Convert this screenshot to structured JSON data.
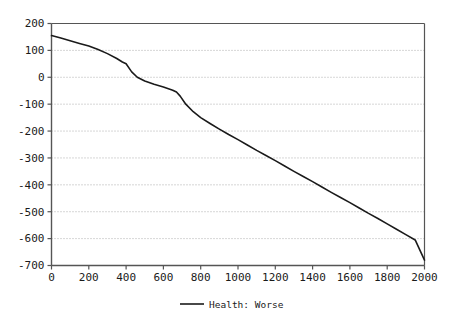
{
  "chart_data": {
    "type": "line",
    "title": "",
    "xlabel": "",
    "ylabel": "",
    "xlim": [
      0,
      2000
    ],
    "ylim": [
      -700,
      200
    ],
    "grid": true,
    "legend_position": "bottom-center",
    "x_ticks": [
      0,
      200,
      400,
      600,
      800,
      1000,
      1200,
      1400,
      1600,
      1800,
      2000
    ],
    "y_ticks": [
      200,
      100,
      0,
      -100,
      -200,
      -300,
      -400,
      -500,
      -600,
      -700
    ],
    "x_tick_labels": [
      "0",
      "200",
      "400",
      "600",
      "800",
      "1000",
      "1200",
      "1400",
      "1600",
      "1800",
      "2000"
    ],
    "y_tick_labels": [
      "200",
      "100",
      "0",
      "-100",
      "-200",
      "-300",
      "-400",
      "-500",
      "-600",
      "-700"
    ],
    "series": [
      {
        "name": "Health: Worse",
        "color": "#1a1a1a",
        "x": [
          0,
          50,
          100,
          150,
          200,
          250,
          300,
          350,
          380,
          400,
          430,
          460,
          500,
          550,
          600,
          650,
          670,
          690,
          720,
          760,
          800,
          850,
          900,
          950,
          1000,
          1050,
          1100,
          1150,
          1200,
          1250,
          1300,
          1350,
          1400,
          1450,
          1500,
          1550,
          1600,
          1650,
          1700,
          1750,
          1800,
          1850,
          1900,
          1950,
          2000
        ],
        "y": [
          155,
          146,
          136,
          126,
          116,
          103,
          88,
          70,
          57,
          50,
          20,
          0,
          -14,
          -26,
          -36,
          -48,
          -55,
          -70,
          -100,
          -128,
          -150,
          -172,
          -193,
          -213,
          -232,
          -252,
          -272,
          -291,
          -310,
          -330,
          -350,
          -369,
          -388,
          -408,
          -428,
          -447,
          -466,
          -486,
          -506,
          -525,
          -545,
          -565,
          -585,
          -605,
          -680
        ]
      }
    ],
    "legend": [
      {
        "label": "Health: Worse",
        "color": "#1a1a1a"
      }
    ]
  },
  "legend_panel": {
    "entry_label": "Health: Worse"
  },
  "colors": {
    "line": "#1a1a1a",
    "axis": "#555555",
    "grid": "#999999",
    "background": "#ffffff",
    "text": "#1a1a1a"
  }
}
